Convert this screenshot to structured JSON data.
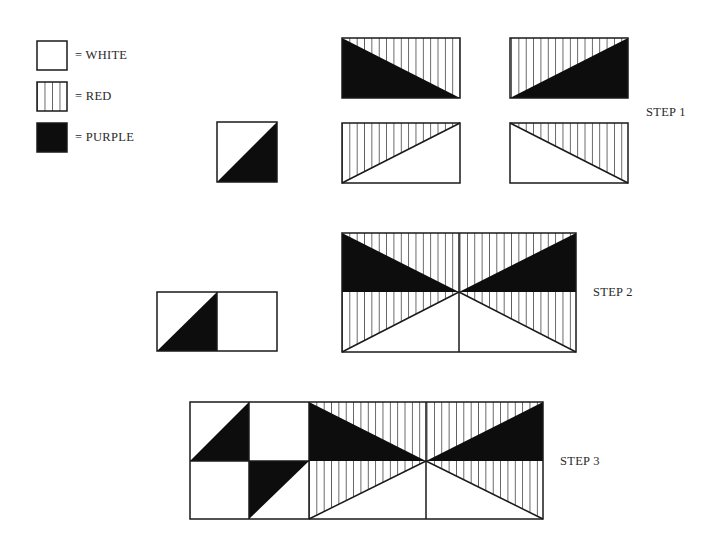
{
  "colors": {
    "white": "#ffffff",
    "red_stripe_line": "#1a1a1a",
    "purple_fill": "#0d0d0d",
    "outline": "#1a1a1a"
  },
  "legend": [
    {
      "pattern": "white",
      "label": "= WHITE"
    },
    {
      "pattern": "red",
      "label": "= RED"
    },
    {
      "pattern": "purple",
      "label": "= PURPLE"
    }
  ],
  "steps": [
    {
      "label": "STEP 1"
    },
    {
      "label": "STEP 2"
    },
    {
      "label": "STEP 3"
    }
  ]
}
